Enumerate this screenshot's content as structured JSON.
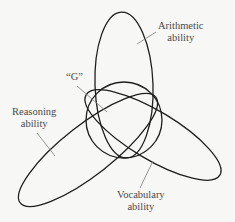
{
  "diagram": {
    "type": "venn-overlap",
    "colors": {
      "background": "#f7f7f5",
      "stroke": "#1e1e1e",
      "leader": "#8a8a8a",
      "text": "#4a4a4a"
    },
    "labels": {
      "g": {
        "line1": "“G”"
      },
      "arithmetic": {
        "line1": "Arithmetic",
        "line2": "ability"
      },
      "reasoning": {
        "line1": "Reasoning",
        "line2": "ability"
      },
      "vocabulary": {
        "line1": "Vocabulary",
        "line2": "ability"
      }
    },
    "shapes": [
      {
        "name": "g-circle",
        "kind": "circle",
        "cx": 124,
        "cy": 120,
        "r": 38
      },
      {
        "name": "arithmetic-ellipse",
        "kind": "ellipse",
        "cx": 124,
        "cy": 85,
        "rx": 29,
        "ry": 73,
        "rotate": -2
      },
      {
        "name": "reasoning-ellipse",
        "kind": "ellipse",
        "cx": 88,
        "cy": 150,
        "rx": 86,
        "ry": 25,
        "rotate": -38
      },
      {
        "name": "vocabulary-ellipse",
        "kind": "ellipse",
        "cx": 153,
        "cy": 135,
        "rx": 78,
        "ry": 24,
        "rotate": 31
      }
    ]
  }
}
